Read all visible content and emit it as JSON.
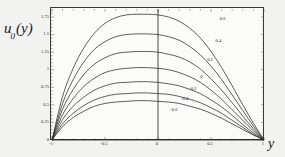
{
  "axis_titles": {
    "y_main": "u",
    "y_sub": "0",
    "y_arg": "(y)",
    "x": "y"
  },
  "colors": {
    "background": "#f2f2f0",
    "plot_background": "#fbfbfa",
    "frame": "#3a3a3a",
    "curve": "#2b2b2b",
    "axis_line": "#1a1a1a",
    "text": "#2a2a2a"
  },
  "chart_data": {
    "type": "line",
    "title": "",
    "xlabel": "y",
    "ylabel": "u0(y)",
    "xlim": [
      -1,
      1
    ],
    "ylim": [
      0,
      1.85
    ],
    "grid": false,
    "legend": "inline-curve-labels",
    "xticks": [
      -1,
      -0.5,
      0,
      0.5,
      1
    ],
    "xtick_labels": [
      "-1",
      "-0.5",
      "0",
      "0.5",
      "1"
    ],
    "yticks": [
      0,
      0.25,
      0.5,
      0.75,
      1,
      1.25,
      1.5,
      1.75
    ],
    "ytick_labels": [
      "0",
      "0.25",
      "0.5",
      "0.75",
      "1",
      "1.25",
      "1.5",
      "1.75"
    ],
    "x": [
      -1,
      -0.9,
      -0.8,
      -0.7,
      -0.6,
      -0.5,
      -0.4,
      -0.3,
      -0.2,
      -0.1,
      0,
      0.1,
      0.2,
      0.3,
      0.4,
      0.5,
      0.6,
      0.7,
      0.8,
      0.9,
      1
    ],
    "series": [
      {
        "name": "0.6",
        "label": "0.6",
        "peak_value": 1.78,
        "peak_x": 0.1,
        "label_x": 0.62,
        "label_y": 1.72,
        "values": [
          0,
          0.62,
          1.02,
          1.31,
          1.52,
          1.66,
          1.74,
          1.78,
          1.79,
          1.79,
          1.78,
          1.75,
          1.69,
          1.59,
          1.45,
          1.26,
          1.03,
          0.77,
          0.5,
          0.24,
          0
        ]
      },
      {
        "name": "0.4",
        "label": "0.4",
        "peak_value": 1.5,
        "peak_x": 0.08,
        "label_x": 0.58,
        "label_y": 1.41,
        "values": [
          0,
          0.52,
          0.86,
          1.11,
          1.29,
          1.4,
          1.47,
          1.5,
          1.51,
          1.51,
          1.5,
          1.47,
          1.42,
          1.33,
          1.21,
          1.05,
          0.86,
          0.64,
          0.42,
          0.2,
          0
        ]
      },
      {
        "name": "0.2",
        "label": "0.2",
        "peak_value": 1.25,
        "peak_x": 0.07,
        "label_x": 0.5,
        "label_y": 1.14,
        "values": [
          0,
          0.44,
          0.72,
          0.93,
          1.08,
          1.17,
          1.23,
          1.25,
          1.26,
          1.26,
          1.25,
          1.22,
          1.18,
          1.11,
          1.01,
          0.87,
          0.71,
          0.53,
          0.34,
          0.16,
          0
        ]
      },
      {
        "name": "0",
        "label": "0",
        "peak_value": 1.02,
        "peak_x": 0.06,
        "label_x": 0.42,
        "label_y": 0.9,
        "values": [
          0,
          0.36,
          0.59,
          0.76,
          0.88,
          0.96,
          1.0,
          1.02,
          1.03,
          1.03,
          1.02,
          1.0,
          0.96,
          0.9,
          0.82,
          0.71,
          0.58,
          0.43,
          0.28,
          0.13,
          0
        ]
      },
      {
        "name": "-0.2",
        "label": "-0.2",
        "peak_value": 0.82,
        "peak_x": 0.05,
        "label_x": 0.34,
        "label_y": 0.72,
        "values": [
          0,
          0.29,
          0.48,
          0.61,
          0.71,
          0.77,
          0.81,
          0.82,
          0.83,
          0.83,
          0.82,
          0.8,
          0.77,
          0.72,
          0.66,
          0.57,
          0.47,
          0.35,
          0.22,
          0.1,
          0
        ]
      },
      {
        "name": "-0.4",
        "label": "-0.4",
        "peak_value": 0.66,
        "peak_x": 0.04,
        "label_x": 0.26,
        "label_y": 0.58,
        "values": [
          0,
          0.23,
          0.38,
          0.49,
          0.57,
          0.62,
          0.65,
          0.66,
          0.67,
          0.67,
          0.66,
          0.65,
          0.62,
          0.58,
          0.53,
          0.46,
          0.38,
          0.28,
          0.18,
          0.08,
          0
        ]
      },
      {
        "name": "-0.6",
        "label": "-0.6",
        "peak_value": 0.55,
        "peak_x": 0.03,
        "label_x": 0.16,
        "label_y": 0.43,
        "values": [
          0,
          0.19,
          0.32,
          0.41,
          0.48,
          0.52,
          0.54,
          0.55,
          0.56,
          0.56,
          0.55,
          0.54,
          0.52,
          0.48,
          0.44,
          0.38,
          0.31,
          0.23,
          0.15,
          0.07,
          0
        ]
      }
    ]
  }
}
